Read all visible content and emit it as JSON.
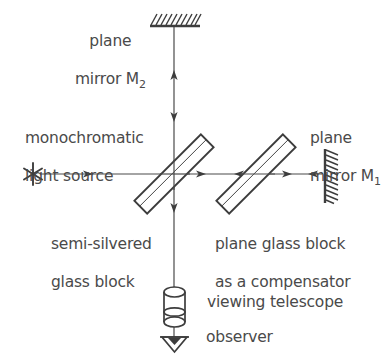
{
  "figure": {
    "background_color": "#ffffff",
    "ink_color": "#3d3d3d",
    "text_color": "#4a4a4a"
  },
  "labels": {
    "mirror_m2_line1": "plane",
    "mirror_m2_line2": "mirror M",
    "mirror_m2_sub": "2",
    "source_line1": "monochromatic",
    "source_line2": "light source",
    "mirror_m1_line1": "plane",
    "mirror_m1_line2": "mirror M",
    "mirror_m1_sub": "1",
    "beamsplitter_line1": "semi-silvered",
    "beamsplitter_line2": "glass block",
    "compensator_line1": "plane glass block",
    "compensator_line2": "as a compensator",
    "telescope": "viewing telescope",
    "observer": "observer"
  },
  "components": {
    "light_source": {
      "name": "monochromatic light source",
      "symbol": "asterisk-star",
      "x": 33,
      "y": 174
    },
    "beam_splitter": {
      "name": "semi-silvered glass block",
      "symbol": "tilted-glass-block",
      "angle_deg": -45,
      "cx": 174,
      "cy": 174
    },
    "compensator": {
      "name": "plane glass block as a compensator",
      "symbol": "tilted-glass-block",
      "angle_deg": -45,
      "cx": 256,
      "cy": 174
    },
    "mirror_m2": {
      "name": "plane mirror M2",
      "symbol": "hatched-bar-horizontal",
      "cx": 174,
      "cy": 22
    },
    "mirror_m1": {
      "name": "plane mirror M1",
      "symbol": "hatched-bar-vertical",
      "cx": 325,
      "cy": 175
    },
    "telescope": {
      "name": "viewing telescope",
      "symbol": "cylinder",
      "cx": 186,
      "cy": 307
    },
    "observer": {
      "name": "observer",
      "symbol": "eye-triangle",
      "cx": 186,
      "cy": 338
    }
  },
  "beams": {
    "source_to_splitter": {
      "from": "light source",
      "to": "beam splitter",
      "direction": "right"
    },
    "splitter_to_m2": {
      "from": "beam splitter",
      "to": "plane mirror M2",
      "direction": "up"
    },
    "m2_to_splitter": {
      "from": "plane mirror M2",
      "to": "beam splitter",
      "direction": "down"
    },
    "splitter_to_m1": {
      "from": "beam splitter",
      "to": "plane mirror M1",
      "direction": "right"
    },
    "m1_to_splitter": {
      "from": "plane mirror M1",
      "to": "beam splitter",
      "direction": "left"
    },
    "splitter_to_telescope": {
      "from": "beam splitter",
      "to": "viewing telescope",
      "direction": "down"
    }
  }
}
